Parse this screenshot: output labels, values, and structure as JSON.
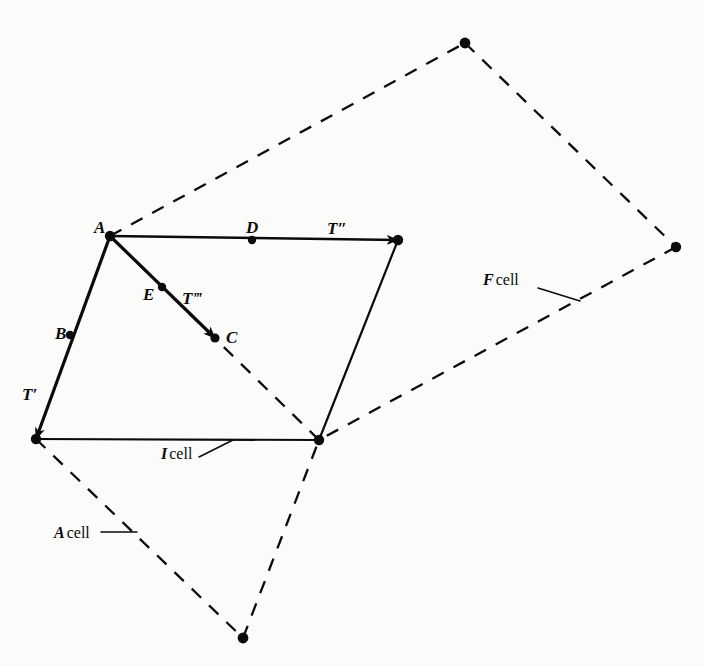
{
  "figure": {
    "type": "crystallographic-lattice-cell-diagram",
    "background_color": "#fbfbfa",
    "ink_color": "#0b0b0b",
    "width": 704,
    "height": 666
  },
  "point_labels": [
    {
      "name": "A",
      "text": "A",
      "x": 94,
      "y": 219,
      "marker_x": 110,
      "marker_y": 236
    },
    {
      "name": "B",
      "text": "B",
      "x": 55,
      "y": 325,
      "marker_x": 70,
      "marker_y": 335
    },
    {
      "name": "C",
      "text": "C",
      "x": 226,
      "y": 329,
      "marker_x": 215,
      "marker_y": 338
    },
    {
      "name": "D",
      "text": "D",
      "x": 246,
      "y": 219,
      "marker_x": 252,
      "marker_y": 240
    },
    {
      "name": "E",
      "text": "E",
      "x": 143,
      "y": 286,
      "marker_x": 162,
      "marker_y": 287
    }
  ],
  "vector_labels": [
    {
      "name": "T-prime",
      "text": "T′",
      "x": 22,
      "y": 386
    },
    {
      "name": "T-double-prime",
      "text": "T″",
      "x": 327,
      "y": 220
    },
    {
      "name": "T-triple-prime",
      "text": "T‴",
      "x": 182,
      "y": 290
    }
  ],
  "cell_labels": [
    {
      "name": "F-cell",
      "symbol": "F",
      "word": "cell",
      "x": 483,
      "y": 272
    },
    {
      "name": "I-cell",
      "symbol": "I",
      "word": "cell",
      "x": 161,
      "y": 446
    },
    {
      "name": "A-cell",
      "symbol": "A",
      "word": "cell",
      "x": 54,
      "y": 525
    }
  ],
  "vertices": {
    "A": {
      "x": 110,
      "y": 236
    },
    "lower_left": {
      "x": 36,
      "y": 439
    },
    "center": {
      "x": 319,
      "y": 440
    },
    "upper_right": {
      "x": 398,
      "y": 240
    },
    "top": {
      "x": 465,
      "y": 43
    },
    "right": {
      "x": 676,
      "y": 247
    },
    "bottom": {
      "x": 243,
      "y": 638
    }
  },
  "markers": [
    {
      "name": "vertex-A",
      "x": 110,
      "y": 236,
      "r": 5.2
    },
    {
      "name": "point-B",
      "x": 70,
      "y": 335,
      "r": 4.2
    },
    {
      "name": "point-D",
      "x": 252,
      "y": 240,
      "r": 4.2
    },
    {
      "name": "point-E",
      "x": 162,
      "y": 287,
      "r": 4.2
    },
    {
      "name": "point-C",
      "x": 215,
      "y": 338,
      "r": 4.6
    },
    {
      "name": "vertex-lower-left",
      "x": 36,
      "y": 439,
      "r": 5.2
    },
    {
      "name": "vertex-center",
      "x": 319,
      "y": 440,
      "r": 5.2
    },
    {
      "name": "vertex-upper-right",
      "x": 398,
      "y": 240,
      "r": 5.2
    },
    {
      "name": "vertex-top",
      "x": 465,
      "y": 43,
      "r": 5.4
    },
    {
      "name": "vertex-right",
      "x": 676,
      "y": 247,
      "r": 5.2
    },
    {
      "name": "vertex-bottom",
      "x": 243,
      "y": 638,
      "r": 5.4
    }
  ],
  "solid_edges": [
    {
      "name": "edge-A-to-lower-left",
      "x1": 110,
      "y1": 236,
      "x2": 36,
      "y2": 439
    },
    {
      "name": "edge-lower-left-to-center",
      "x1": 36,
      "y1": 439,
      "x2": 319,
      "y2": 440
    },
    {
      "name": "edge-center-to-upper-right",
      "x1": 319,
      "y1": 440,
      "x2": 398,
      "y2": 240
    },
    {
      "name": "edge-A-to-upper-right",
      "x1": 110,
      "y1": 236,
      "x2": 398,
      "y2": 240
    },
    {
      "name": "edge-A-to-C",
      "x1": 110,
      "y1": 236,
      "x2": 215,
      "y2": 338
    }
  ],
  "dashed_edges": [
    {
      "name": "dashed-A-to-top",
      "x1": 110,
      "y1": 236,
      "x2": 465,
      "y2": 43
    },
    {
      "name": "dashed-top-to-right",
      "x1": 465,
      "y1": 43,
      "x2": 676,
      "y2": 247
    },
    {
      "name": "dashed-right-to-center",
      "x1": 676,
      "y1": 247,
      "x2": 319,
      "y2": 440
    },
    {
      "name": "dashed-center-to-A",
      "x1": 319,
      "y1": 440,
      "x2": 110,
      "y2": 236
    },
    {
      "name": "dashed-lower-left-to-bottom",
      "x1": 36,
      "y1": 439,
      "x2": 243,
      "y2": 638
    },
    {
      "name": "dashed-bottom-to-center",
      "x1": 243,
      "y1": 638,
      "x2": 319,
      "y2": 440
    }
  ],
  "leader_lines": [
    {
      "name": "leader-F-cell",
      "x1": 538,
      "y1": 288,
      "x2": 580,
      "y2": 301
    },
    {
      "name": "leader-I-cell",
      "x1": 199,
      "y1": 457,
      "x2": 233,
      "y2": 440
    },
    {
      "name": "leader-A-cell",
      "x1": 101,
      "y1": 532,
      "x2": 137,
      "y2": 532
    }
  ],
  "bleedthrough": [
    {
      "name": "bleed-top",
      "x": 40,
      "y": 6,
      "text": " "
    },
    {
      "name": "bleed-caption-1",
      "x": 8,
      "y": 570,
      "text": " "
    },
    {
      "name": "bleed-caption-2",
      "x": 8,
      "y": 596,
      "text": " "
    }
  ]
}
